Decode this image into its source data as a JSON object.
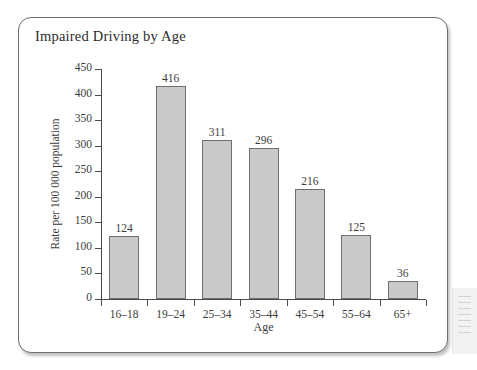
{
  "figure": {
    "title": "Impaired Driving by Age"
  },
  "chart_data": {
    "type": "bar",
    "title": "Impaired Driving by Age",
    "xlabel": "Age",
    "ylabel": "Rate per 100 000 population",
    "categories": [
      "16–18",
      "19–24",
      "25–34",
      "35–44",
      "45–54",
      "55–64",
      "65+"
    ],
    "values": [
      124,
      416,
      311,
      296,
      216,
      125,
      36
    ],
    "value_labels": [
      "124",
      "416",
      "311",
      "296",
      "216",
      "125",
      "36"
    ],
    "ylim": [
      0,
      450
    ],
    "ytick_labels": [
      "0",
      "50",
      "100",
      "150",
      "200",
      "250",
      "300",
      "350",
      "400",
      "450"
    ],
    "ytick_values": [
      0,
      50,
      100,
      150,
      200,
      250,
      300,
      350,
      400,
      450
    ],
    "grid": false,
    "legend": false,
    "bar_color": "#c9c9c9",
    "bar_border_color": "#6f6f6f",
    "axis_color": "#4a4a4a",
    "text_color": "#3c3c3c"
  }
}
